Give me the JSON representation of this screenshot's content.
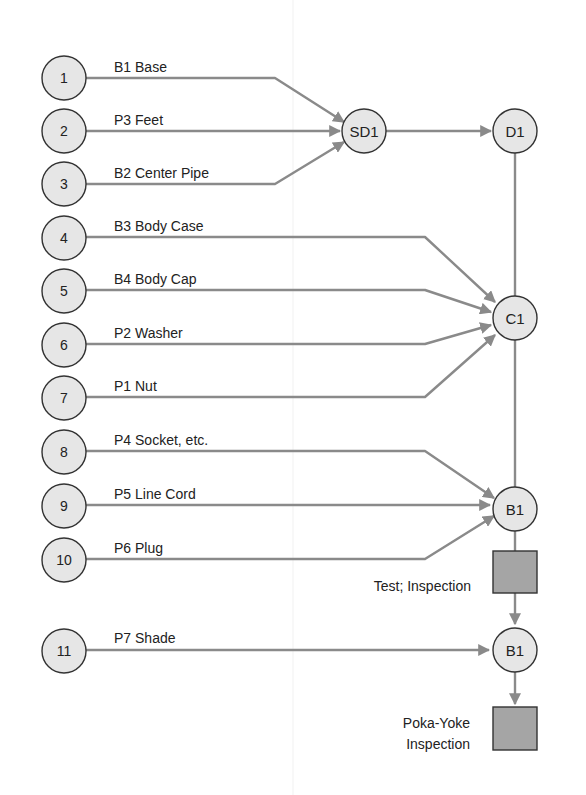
{
  "figure": {
    "type": "assembly-chart",
    "colors": {
      "node_fill": "#e6e6e6",
      "node_stroke": "#333333",
      "flow_line": "#8a8a8a",
      "inspection_fill": "#a5a5a5",
      "background": "#ffffff"
    }
  },
  "components": [
    {
      "number": "1",
      "label": "B1 Base",
      "target": "SD1"
    },
    {
      "number": "2",
      "label": "P3 Feet",
      "target": "SD1"
    },
    {
      "number": "3",
      "label": "B2 Center Pipe",
      "target": "SD1"
    },
    {
      "number": "4",
      "label": "B3 Body Case",
      "target": "C1"
    },
    {
      "number": "5",
      "label": "B4 Body Cap",
      "target": "C1"
    },
    {
      "number": "6",
      "label": "P2 Washer",
      "target": "C1"
    },
    {
      "number": "7",
      "label": "P1 Nut",
      "target": "C1"
    },
    {
      "number": "8",
      "label": "P4 Socket, etc.",
      "target": "B1"
    },
    {
      "number": "9",
      "label": "P5 Line Cord",
      "target": "B1"
    },
    {
      "number": "10",
      "label": "P6 Plug",
      "target": "B1"
    },
    {
      "number": "11",
      "label": "P7 Shade",
      "target": "B1 (final)"
    }
  ],
  "operations": {
    "sd1": "SD1",
    "d1": "D1",
    "c1": "C1",
    "b1_first": "B1",
    "b1_second": "B1"
  },
  "inspections": {
    "test": "Test; Inspection",
    "pokayoke_line1": "Poka-Yoke",
    "pokayoke_line2": "Inspection"
  }
}
